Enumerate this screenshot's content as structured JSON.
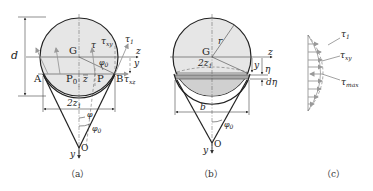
{
  "figure_a": {
    "caption": "（a）",
    "labels": {
      "d": "d",
      "G": "G",
      "A": "A",
      "B": "B",
      "P0": "P",
      "P0_sub": "0",
      "P": "P",
      "z_bar": "z",
      "z_axis": "z",
      "y_axis": "y",
      "y_dim": "y",
      "tau": "τ",
      "tau_xz": "τ",
      "tau_xz_sub": "xz",
      "tau_xy": "τ",
      "tau_xy_sub": "xy",
      "tau1": "τ",
      "tau1_sub": "1",
      "phi0_top": "φ",
      "phi0_top_sub": "0",
      "two_z1": "2z",
      "two_z1_sub": "1",
      "phi": "φ",
      "phi0": "φ",
      "phi0_sub": "0",
      "O": "O",
      "y_bottom": "y"
    }
  },
  "figure_b": {
    "caption": "（b）",
    "labels": {
      "r": "r",
      "G": "G",
      "two_z1": "2z",
      "two_z1_sub": "1",
      "z_axis": "z",
      "y_dim": "y",
      "eta": "η",
      "d_eta": "dη",
      "b": "b",
      "phi0": "φ",
      "phi0_sub": "0",
      "O": "O",
      "y_bottom": "y"
    }
  },
  "figure_c": {
    "caption": "（c）",
    "labels": {
      "tau1": "τ",
      "tau1_sub": "1",
      "tau_xy": "τ",
      "tau_xy_sub": "xy",
      "tau_max": "τ",
      "tau_max_sub": "max"
    }
  },
  "colors": {
    "fill_circle": "#e6e6e6",
    "fill_strip": "#bdbdbd",
    "line": "#222222",
    "vector": "#999999"
  }
}
